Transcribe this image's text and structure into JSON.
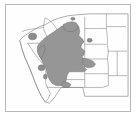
{
  "figure": {
    "type": "range-map",
    "title": "Western United States distribution range map",
    "region": "Western United States",
    "background_color": "#ffffff",
    "frame_color": "#b9b9b9",
    "land_fill_color": "#fefefe",
    "state_border_color": "#8a8a8a",
    "range_fill_color": "#969696",
    "range_border_color": "#6f6f6f",
    "outlier_fill_color": "#8c8c8c",
    "legend_present": false,
    "labels_present": false,
    "scale_bar_present": false
  },
  "range": {
    "name": "shaded distribution area",
    "core_states": [
      "Nevada",
      "Utah",
      "Colorado",
      "Wyoming",
      "Montana",
      "Arizona",
      "New Mexico",
      "Idaho"
    ],
    "peripheral_states": [
      "California",
      "Oregon",
      "Kansas",
      "Nebraska",
      "Texas"
    ],
    "disjunct_patches": [
      "central Oregon",
      "southeastern California",
      "western South Dakota"
    ]
  },
  "states_outlined": [
    "Washington",
    "Oregon",
    "California",
    "Idaho",
    "Nevada",
    "Utah",
    "Arizona",
    "Montana",
    "Wyoming",
    "Colorado",
    "New Mexico",
    "North Dakota",
    "South Dakota",
    "Nebraska",
    "Kansas",
    "Oklahoma",
    "Texas",
    "Minnesota",
    "Iowa",
    "Missouri"
  ]
}
